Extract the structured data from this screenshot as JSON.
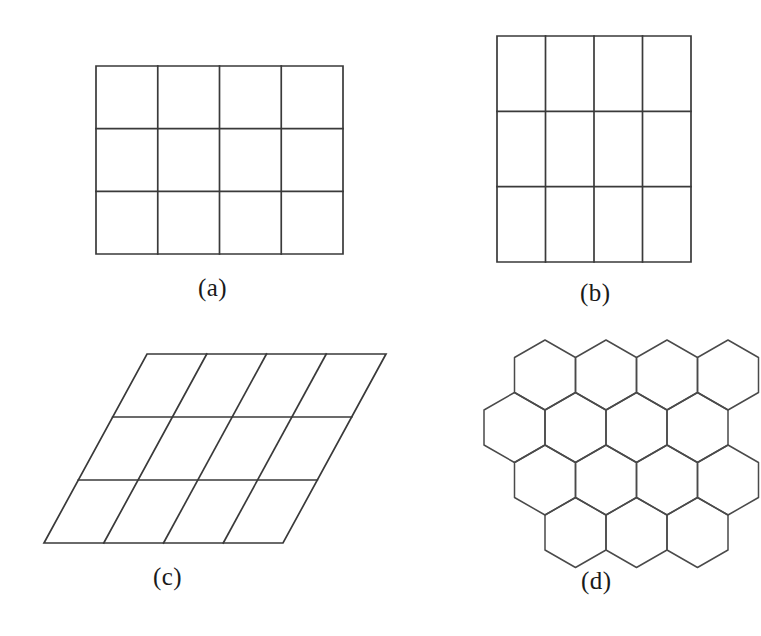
{
  "figure": {
    "background_color": "#ffffff",
    "stroke_color": "#3a3a3a",
    "label_color": "#1a1a1a",
    "panel_count": 4
  },
  "labels": {
    "a": "(a)",
    "b": "(b)",
    "c": "(c)",
    "d": "(d)"
  },
  "panels": [
    {
      "id": "a",
      "label": "(a)",
      "shape": "rectangular-grid",
      "description": "Rectangular lattice, cells wider than tall",
      "columns": 4,
      "rows": 3,
      "bounds": {
        "x": 96,
        "y": 66,
        "width": 247,
        "height": 188
      },
      "cell_width": 61.75,
      "cell_height": 62.67,
      "skew_deg": 0
    },
    {
      "id": "b",
      "label": "(b)",
      "shape": "rectangular-grid",
      "description": "Rectangular lattice, cells taller than wide",
      "columns": 4,
      "rows": 3,
      "bounds": {
        "x": 497,
        "y": 36,
        "width": 194,
        "height": 226
      },
      "cell_width": 48.5,
      "cell_height": 75.33,
      "skew_deg": 0
    },
    {
      "id": "c",
      "label": "(c)",
      "shape": "oblique-grid",
      "description": "Oblique (sheared) lattice, parallelogram cells",
      "columns": 4,
      "rows": 3,
      "bounds": {
        "x": 44,
        "y": 354,
        "width": 239,
        "height": 189
      },
      "top_left": [
        147,
        354
      ],
      "top_right": [
        386,
        354
      ],
      "bottom_left": [
        44,
        543
      ],
      "bottom_right": [
        283,
        543
      ],
      "shear_offset_px": 103,
      "skew_deg": -28.6
    },
    {
      "id": "d",
      "label": "(d)",
      "shape": "hexagonal-grid",
      "description": "Hexagonal honeycomb lattice, flat-top hexagons",
      "rows": 4,
      "hexes_per_long_row": 4,
      "hexes_per_short_row": 3,
      "total_hexes": 14,
      "bounds": {
        "x": 484,
        "y": 340,
        "width": 242,
        "height": 218
      },
      "hex_width": 61,
      "hex_height": 70,
      "orientation": "flat-top"
    }
  ],
  "chart_data": {
    "type": "diagram",
    "series": [
      {
        "name": "(a)",
        "kind": "rectangular",
        "cols": 4,
        "rows": 3,
        "cells": 12
      },
      {
        "name": "(b)",
        "kind": "rectangular",
        "cols": 4,
        "rows": 3,
        "cells": 12
      },
      {
        "name": "(c)",
        "kind": "oblique",
        "cols": 4,
        "rows": 3,
        "cells": 12
      },
      {
        "name": "(d)",
        "kind": "hexagonal",
        "cells": 14
      }
    ]
  }
}
